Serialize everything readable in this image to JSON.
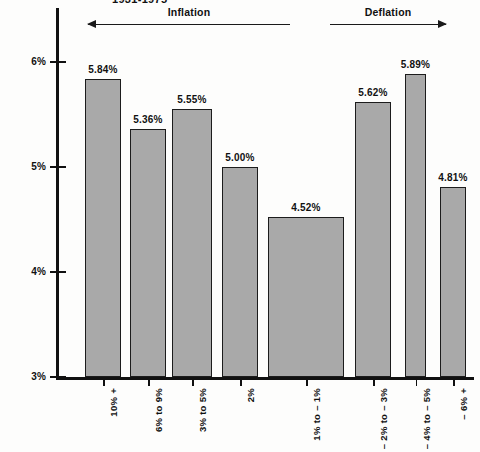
{
  "chart_data": {
    "type": "bar",
    "title": "1931-1975",
    "xlabel": "",
    "ylabel": "",
    "ylim": [
      3,
      6.3
    ],
    "grid": false,
    "yticks": [
      "3%",
      "4%",
      "5%",
      "6%"
    ],
    "ytick_values": [
      3,
      4,
      5,
      6
    ],
    "categories": [
      "10% +",
      "6% to 9%",
      "3% to 5%",
      "2%",
      "1% to – 1%",
      "– 2% to – 3%",
      "– 4% to – 5%",
      "– 6% +"
    ],
    "values": [
      5.84,
      5.36,
      5.55,
      5.0,
      4.52,
      5.62,
      5.89,
      4.81
    ],
    "value_labels": [
      "5.84%",
      "5.36%",
      "5.55%",
      "5.00%",
      "4.52%",
      "5.62%",
      "5.89%",
      "4.81%"
    ],
    "annotations": [
      {
        "label": "Inflation",
        "direction": "left",
        "covers": [
          0,
          4
        ]
      },
      {
        "label": "Deflation",
        "direction": "right",
        "covers": [
          5,
          7
        ]
      }
    ],
    "colors": {
      "bar_fill": "#a9a9a9",
      "bar_stroke": "#1c1c1c",
      "axis": "#111111",
      "text": "#111111",
      "background": "#fdfdfc"
    }
  }
}
